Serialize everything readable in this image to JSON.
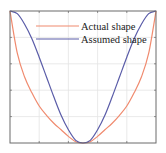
{
  "chart_data": {
    "type": "line",
    "title": "",
    "xlabel": "",
    "ylabel": "",
    "xlim": [
      -1,
      1
    ],
    "ylim": [
      0,
      1
    ],
    "grid": true,
    "x_ticks": 6,
    "y_ticks": 6,
    "tick_labels_visible": false,
    "legend": {
      "position": "upper-center",
      "entries": [
        "Actual shape",
        "Assumed shape"
      ]
    },
    "x": [
      -1.0,
      -0.9,
      -0.8,
      -0.7,
      -0.6,
      -0.5,
      -0.4,
      -0.3,
      -0.2,
      -0.1,
      0.0,
      0.1,
      0.2,
      0.3,
      0.4,
      0.5,
      0.6,
      0.7,
      0.8,
      0.9,
      1.0
    ],
    "series": [
      {
        "name": "Actual shape",
        "color": "#f08a6e",
        "values": [
          1.0,
          0.68,
          0.5,
          0.38,
          0.28,
          0.21,
          0.15,
          0.1,
          0.05,
          0.01,
          0.0,
          0.01,
          0.05,
          0.1,
          0.15,
          0.21,
          0.28,
          0.38,
          0.5,
          0.68,
          1.0
        ]
      },
      {
        "name": "Assumed shape",
        "color": "#5a5ca8",
        "values": [
          1.0,
          0.98,
          0.9,
          0.79,
          0.65,
          0.5,
          0.35,
          0.21,
          0.1,
          0.02,
          0.0,
          0.02,
          0.1,
          0.21,
          0.35,
          0.5,
          0.65,
          0.79,
          0.9,
          0.98,
          1.0
        ]
      }
    ]
  },
  "legend": {
    "actual_label": "Actual shape",
    "assumed_label": "Assumed shape"
  }
}
